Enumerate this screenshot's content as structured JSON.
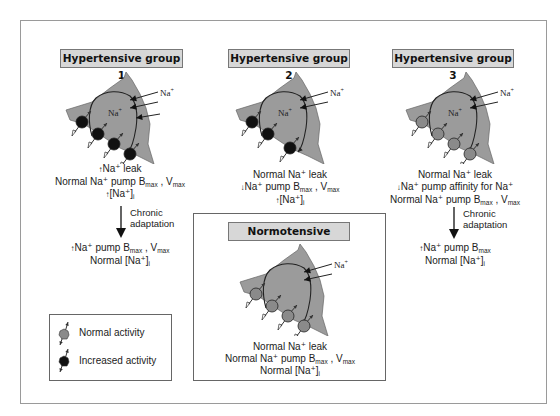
{
  "groups": [
    {
      "title": "Hypertensive group 1",
      "pump_activity": "increased",
      "pump_count": 4,
      "leak_arrows": 3,
      "label_inside": "Na+",
      "label_outside": "Na+",
      "lines": [
        {
          "prefix_arrow": "up",
          "text": "Na⁺ leak"
        },
        {
          "prefix_arrow": "",
          "text": "Normal Na⁺ pump B",
          "sub": "max",
          "tail": " , V",
          "sub2": "max"
        },
        {
          "prefix_arrow": "up",
          "text": "[Na⁺]",
          "sub": "i"
        }
      ],
      "adaptation": {
        "label_1": "Chronic",
        "label_2": "adaptation",
        "lines": [
          {
            "prefix_arrow": "up",
            "text": "Na⁺ pump B",
            "sub": "max",
            "tail": " , V",
            "sub2": "max"
          },
          {
            "prefix_arrow": "",
            "text": "Normal [Na⁺]",
            "sub": "i"
          }
        ]
      }
    },
    {
      "title": "Hypertensive group 2",
      "pump_activity": "increased",
      "pump_count": 3,
      "leak_arrows": 2,
      "label_inside": "Na+",
      "label_outside": "Na+",
      "lines": [
        {
          "prefix_arrow": "",
          "text": "Normal Na⁺ leak"
        },
        {
          "prefix_arrow": "down",
          "text": "Na⁺ pump B",
          "sub": "max",
          "tail": " , V",
          "sub2": "max"
        },
        {
          "prefix_arrow": "up",
          "text": "[Na⁺]",
          "sub": "i"
        }
      ]
    },
    {
      "title": "Hypertensive group 3",
      "pump_activity": "normal",
      "pump_count": 4,
      "leak_arrows": 2,
      "label_inside": "Na+",
      "label_outside": "Na+",
      "lines": [
        {
          "prefix_arrow": "",
          "text": "Normal Na⁺ leak"
        },
        {
          "prefix_arrow": "down",
          "text": "Na⁺ pump affinity for Na⁺"
        },
        {
          "prefix_arrow": "",
          "text": "Normal Na⁺ pump B",
          "sub": "max",
          "tail": " , V",
          "sub2": "max"
        }
      ],
      "adaptation": {
        "label_1": "Chronic",
        "label_2": "adaptation",
        "lines": [
          {
            "prefix_arrow": "up",
            "text": "Na⁺ pump B",
            "sub": "max"
          },
          {
            "prefix_arrow": "",
            "text": "Normal [Na⁺]",
            "sub": "i"
          }
        ]
      }
    },
    {
      "title": "Normotensive",
      "pump_activity": "normal",
      "pump_count": 4,
      "leak_arrows": 2,
      "label_inside": "",
      "label_outside": "Na+",
      "lines": [
        {
          "prefix_arrow": "",
          "text": "Normal Na⁺ leak"
        },
        {
          "prefix_arrow": "",
          "text": "Normal Na⁺ pump B",
          "sub": "max",
          "tail": " , V",
          "sub2": "max"
        },
        {
          "prefix_arrow": "",
          "text": "Normal [Na⁺]",
          "sub": "i"
        }
      ]
    }
  ],
  "legend": {
    "items": [
      {
        "label": "Normal activity",
        "activity": "normal"
      },
      {
        "label": "Increased activity",
        "activity": "increased"
      }
    ]
  },
  "colors": {
    "cell_fill": "#9b9b9b",
    "pump_normal": "#8a8a8a",
    "pump_increased": "#111111",
    "header_fill": "#d7d7d7"
  }
}
